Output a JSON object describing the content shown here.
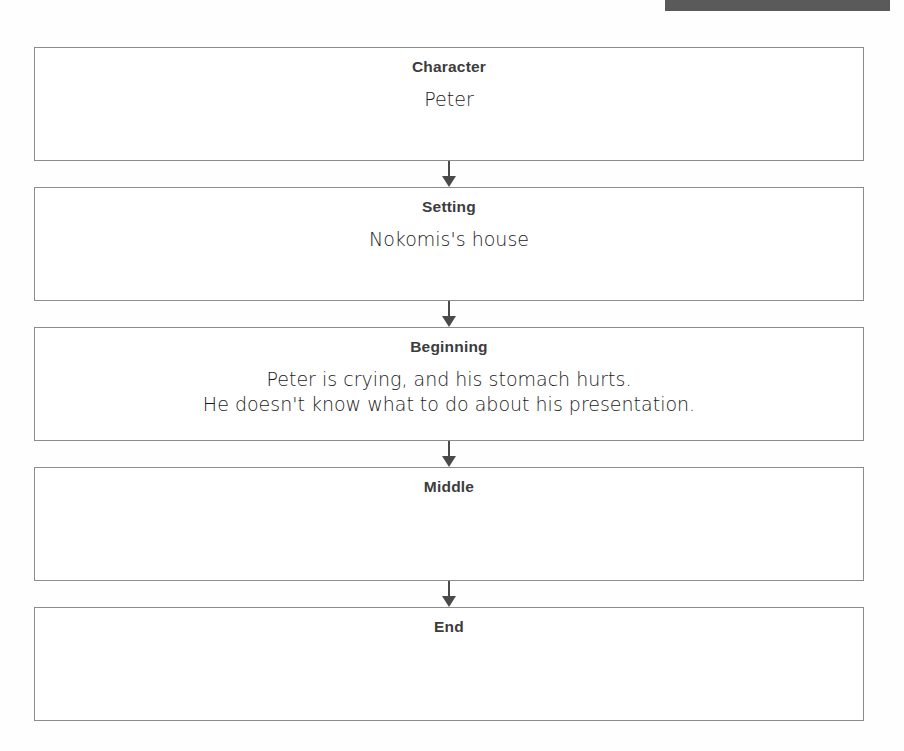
{
  "worksheet": {
    "title": "Story Map",
    "scan_artifact_color": "#5a5a5a",
    "border_color": "#8c8c8c",
    "heading_color": "#3c3c3c",
    "handwriting_color": "#1a1a1a",
    "nodes": [
      {
        "heading": "Character",
        "response": "Peter"
      },
      {
        "heading": "Setting",
        "response": "Nokomis's house"
      },
      {
        "heading": "Beginning",
        "response": "Peter is crying, and his stomach hurts.\nHe doesn't know what to do about his presentation."
      },
      {
        "heading": "Middle",
        "response": ""
      },
      {
        "heading": "End",
        "response": ""
      }
    ],
    "connectors": [
      {
        "icon": "arrow-down-icon"
      },
      {
        "icon": "arrow-down-icon"
      },
      {
        "icon": "arrow-down-icon"
      },
      {
        "icon": "arrow-down-icon"
      }
    ]
  }
}
